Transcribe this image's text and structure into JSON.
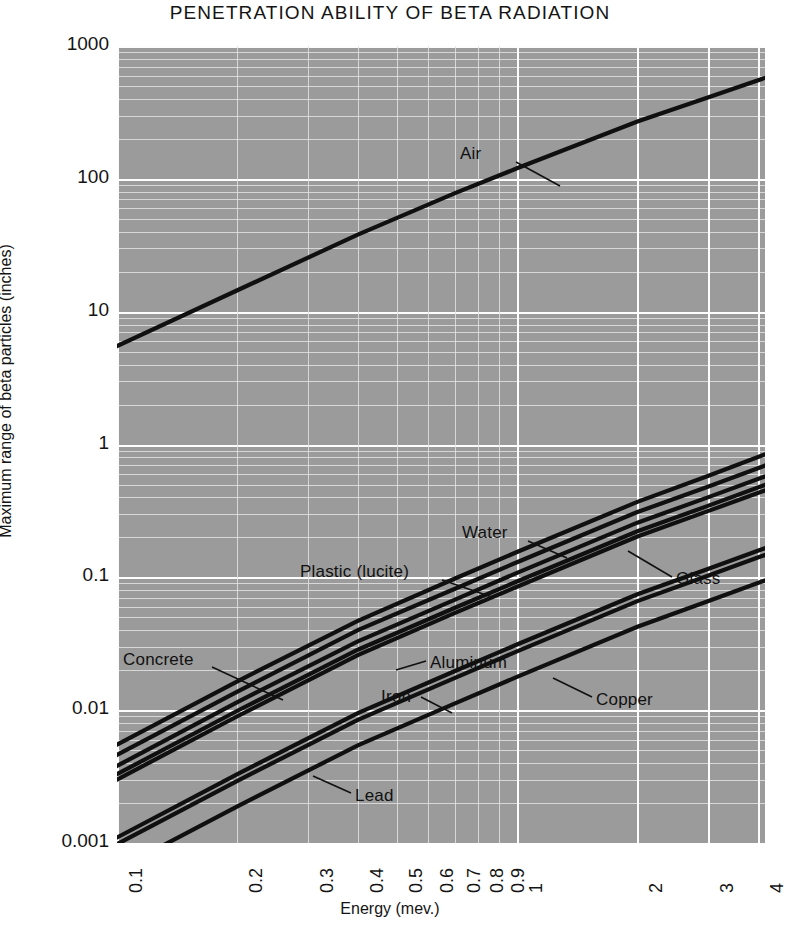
{
  "chart_data": {
    "type": "line",
    "title": "PENETRATION ABILITY OF BETA RADIATION",
    "xlabel": "Energy (mev.)",
    "ylabel": "Maximum range of beta particles (inches)",
    "xscale": "log",
    "yscale": "log",
    "xlim": [
      0.1,
      4.3
    ],
    "ylim": [
      0.001,
      1000
    ],
    "grid": true,
    "legend": "inline-annotations",
    "xticks": [
      "0.1",
      "0.2",
      "0.3",
      "0.4",
      "0.5",
      "0.6",
      "0.7",
      "0.8",
      "0.9",
      "1",
      "2",
      "3",
      "4"
    ],
    "xtick_values": [
      0.1,
      0.2,
      0.3,
      0.4,
      0.5,
      0.6,
      0.7,
      0.8,
      0.9,
      1,
      2,
      3,
      4
    ],
    "yticks": [
      "1000",
      "100",
      "10",
      "1",
      "0.1",
      "0.01",
      "0.001"
    ],
    "ytick_values": [
      1000,
      100,
      10,
      1,
      0.1,
      0.01,
      0.001
    ],
    "series": [
      {
        "name": "Air",
        "x": [
          0.1,
          0.2,
          0.4,
          0.7,
          1.0,
          2.0,
          3.0,
          4.2
        ],
        "y": [
          5.5,
          14.5,
          38,
          78,
          120,
          270,
          410,
          580
        ]
      },
      {
        "name": "Water",
        "x": [
          0.1,
          0.2,
          0.4,
          0.7,
          1.0,
          2.0,
          3.0,
          4.2
        ],
        "y": [
          0.0055,
          0.0165,
          0.047,
          0.098,
          0.155,
          0.37,
          0.58,
          0.85
        ]
      },
      {
        "name": "Plastic (lucite)",
        "x": [
          0.1,
          0.2,
          0.4,
          0.7,
          1.0,
          2.0,
          3.0,
          4.2
        ],
        "y": [
          0.0046,
          0.0138,
          0.04,
          0.082,
          0.13,
          0.31,
          0.48,
          0.7
        ]
      },
      {
        "name": "Glass",
        "x": [
          0.1,
          0.2,
          0.4,
          0.7,
          1.0,
          2.0,
          3.0,
          4.2
        ],
        "y": [
          0.0038,
          0.0115,
          0.033,
          0.068,
          0.108,
          0.258,
          0.4,
          0.58
        ]
      },
      {
        "name": "Concrete",
        "x": [
          0.1,
          0.2,
          0.4,
          0.7,
          1.0,
          2.0,
          3.0,
          4.2
        ],
        "y": [
          0.0033,
          0.0099,
          0.0285,
          0.059,
          0.093,
          0.222,
          0.345,
          0.5
        ]
      },
      {
        "name": "Aluminum",
        "x": [
          0.1,
          0.2,
          0.4,
          0.7,
          1.0,
          2.0,
          3.0,
          4.2
        ],
        "y": [
          0.003,
          0.009,
          0.026,
          0.054,
          0.085,
          0.203,
          0.315,
          0.455
        ]
      },
      {
        "name": "Iron",
        "x": [
          0.1,
          0.2,
          0.4,
          0.7,
          1.0,
          2.0,
          3.0,
          4.2
        ],
        "y": [
          0.0011,
          0.0033,
          0.0095,
          0.0197,
          0.0312,
          0.0745,
          0.1155,
          0.167
        ]
      },
      {
        "name": "Copper",
        "x": [
          0.1,
          0.2,
          0.4,
          0.7,
          1.0,
          2.0,
          3.0,
          4.2
        ],
        "y": [
          0.00098,
          0.00294,
          0.00845,
          0.0175,
          0.0277,
          0.0662,
          0.1027,
          0.1485
        ]
      },
      {
        "name": "Lead",
        "x": [
          0.1,
          0.2,
          0.4,
          0.7,
          1.0,
          2.0,
          3.0,
          4.2
        ],
        "y": [
          0.00063,
          0.00189,
          0.00543,
          0.01125,
          0.0178,
          0.0425,
          0.066,
          0.0955
        ]
      }
    ],
    "annotations": [
      {
        "label": "Air",
        "x": 460,
        "y": 144,
        "leader": [
          516,
          162,
          560,
          186
        ]
      },
      {
        "label": "Water",
        "x": 462,
        "y": 523,
        "leader": [
          528,
          541,
          567,
          558
        ]
      },
      {
        "label": "Plastic (lucite)",
        "x": 300,
        "y": 562,
        "leader": [
          442,
          580,
          492,
          597
        ]
      },
      {
        "label": "Glass",
        "x": 676,
        "y": 569,
        "leader": [
          672,
          577,
          628,
          551
        ]
      },
      {
        "label": "Concrete",
        "x": 123,
        "y": 650,
        "leader": [
          212,
          667,
          283,
          700
        ]
      },
      {
        "label": "Aluminum",
        "x": 430,
        "y": 653,
        "leader": [
          426,
          661,
          396,
          670
        ]
      },
      {
        "label": "Iron",
        "x": 381,
        "y": 687,
        "leader": [
          421,
          697,
          452,
          713
        ]
      },
      {
        "label": "Copper",
        "x": 596,
        "y": 690,
        "leader": [
          592,
          697,
          553,
          678
        ]
      },
      {
        "label": "Lead",
        "x": 355,
        "y": 786,
        "leader": [
          351,
          793,
          313,
          776
        ]
      }
    ]
  },
  "colors": {
    "plot_background": "#9b9b9b",
    "gridline": "#fdfdfd",
    "curve": "#101010",
    "text": "#141414",
    "page_background": "#ffffff"
  }
}
